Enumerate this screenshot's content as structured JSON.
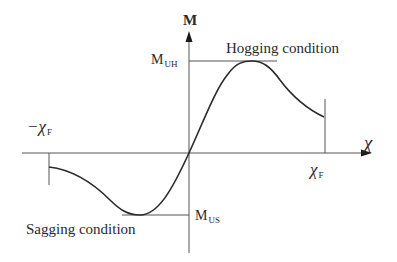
{
  "diagram": {
    "title": "",
    "axes": {
      "y_label": "M",
      "x_label": "χ"
    },
    "labels": {
      "m_uh_main": "M",
      "m_uh_sub": "UH",
      "m_us_main": "M",
      "m_us_sub": "US",
      "chi_f_pos_main": "χ",
      "chi_f_pos_sub": "F",
      "chi_f_neg_main": "−χ",
      "chi_f_neg_sub": "F",
      "hogging": "Hogging condition",
      "sagging": "Sagging condition"
    },
    "colors": {
      "line": "#2a2a2a",
      "axis": "#555555",
      "background": "#ffffff"
    }
  }
}
